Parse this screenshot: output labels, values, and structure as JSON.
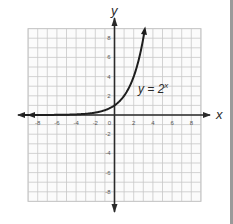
{
  "chart_data": {
    "type": "line",
    "title": "",
    "function_label": "y = 2^x",
    "function_label_base": "y = 2",
    "function_label_exp": "x",
    "xlabel": "x",
    "ylabel": "y",
    "xlim": [
      -9,
      9
    ],
    "ylim": [
      -9,
      9
    ],
    "grid": true,
    "legend_position": "none",
    "x_tick_labels": [
      "-8",
      "-6",
      "-4",
      "-2",
      "0",
      "2",
      "4",
      "6",
      "8"
    ],
    "y_tick_labels": [
      "8",
      "6",
      "4",
      "2",
      "-2",
      "-4",
      "-6",
      "-8"
    ],
    "series": [
      {
        "name": "y = 2^x",
        "x": [
          -9,
          -8,
          -7,
          -6,
          -5,
          -4,
          -3,
          -2,
          -1,
          0,
          1,
          2,
          3,
          3.17
        ],
        "y": [
          0.002,
          0.004,
          0.008,
          0.016,
          0.031,
          0.063,
          0.125,
          0.25,
          0.5,
          1,
          2,
          4,
          8,
          9
        ]
      }
    ]
  },
  "colors": {
    "grid": "#c8c8c8",
    "axis": "#2a2a2a",
    "curve": "#1e1e1e",
    "tick_text": "#555555",
    "background": "#ffffff"
  }
}
